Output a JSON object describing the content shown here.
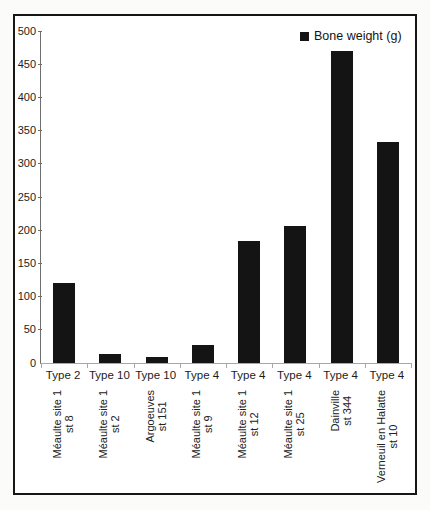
{
  "chart_data": {
    "type": "bar",
    "title": "",
    "legend": {
      "label": "Bone weight (g)",
      "position": "top-right",
      "marker_color": "#141414"
    },
    "categories": [
      {
        "type": "Type 2",
        "site_lines": [
          "Méaulte site 1",
          "st 8"
        ]
      },
      {
        "type": "Type 10",
        "site_lines": [
          "Méaulte site 1",
          "st 2"
        ]
      },
      {
        "type": "Type 10",
        "site_lines": [
          "Argoeuves",
          "st 151"
        ]
      },
      {
        "type": "Type 4",
        "site_lines": [
          "Méaulte site 1",
          "st 9"
        ]
      },
      {
        "type": "Type 4",
        "site_lines": [
          "Méaulte site 1",
          "st 12"
        ]
      },
      {
        "type": "Type 4",
        "site_lines": [
          "Méaulte site 1",
          "st 25"
        ]
      },
      {
        "type": "Type 4",
        "site_lines": [
          "Dainville",
          "st 344"
        ]
      },
      {
        "type": "Type 4",
        "site_lines": [
          "Verneuil en Halatte",
          "st 10"
        ]
      }
    ],
    "values": [
      120,
      13,
      9,
      27,
      184,
      207,
      470,
      333
    ],
    "xlabel": "",
    "ylabel": "",
    "ylim": [
      0,
      500
    ],
    "ytick_step": 50,
    "yticks": [
      0,
      50,
      100,
      150,
      200,
      250,
      300,
      350,
      400,
      450,
      500
    ],
    "bar_color": "#141414",
    "grid": false
  },
  "colors": {
    "frame_border": "#161616",
    "axis": "#6e6e6e",
    "baseline": "#a8a8a8",
    "text": "#1c1c1c",
    "page_background": "#fbfbfa",
    "plot_background": "#ffffff"
  }
}
